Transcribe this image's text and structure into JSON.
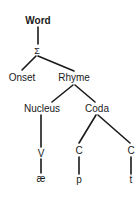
{
  "diagram": {
    "type": "syllable-structure-tree",
    "nodes": {
      "word": "Word",
      "syllable": "Σ",
      "onset": "Onset",
      "rhyme": "Rhyme",
      "nucleus": "Nucleus",
      "coda": "Coda",
      "v_slot": "V",
      "c_slot_1": "C",
      "c_slot_2": "C",
      "seg_ae": "æ",
      "seg_p": "p",
      "seg_t": "t"
    },
    "edges": [
      [
        "word",
        "syllable"
      ],
      [
        "syllable",
        "onset"
      ],
      [
        "syllable",
        "rhyme"
      ],
      [
        "rhyme",
        "nucleus"
      ],
      [
        "rhyme",
        "coda"
      ],
      [
        "nucleus",
        "v_slot"
      ],
      [
        "coda",
        "c_slot_1"
      ],
      [
        "coda",
        "c_slot_2"
      ],
      [
        "v_slot",
        "seg_ae"
      ],
      [
        "c_slot_1",
        "seg_p"
      ],
      [
        "c_slot_2",
        "seg_t"
      ]
    ]
  }
}
